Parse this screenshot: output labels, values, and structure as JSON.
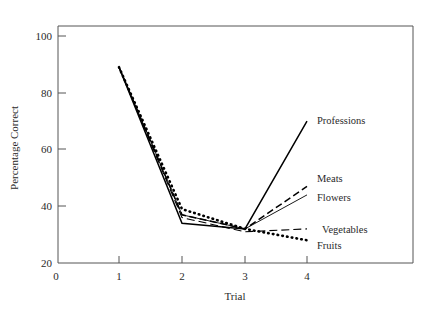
{
  "chart_data": {
    "type": "line",
    "title": "",
    "xlabel": "Trial",
    "ylabel": "Percentage Correct",
    "xlim": [
      0,
      4.6
    ],
    "ylim": [
      20,
      104
    ],
    "xticks": [
      0,
      1,
      2,
      3,
      4
    ],
    "xtick_labels": [
      "0",
      "1",
      "2",
      "3",
      "4"
    ],
    "yticks": [
      20,
      40,
      60,
      80,
      100
    ],
    "ytick_labels": [
      "20",
      "40",
      "60",
      "80",
      "100"
    ],
    "grid": false,
    "legend_position": "right-inline-labels",
    "x": [
      1,
      2,
      3,
      4
    ],
    "series": [
      {
        "name": "Professions",
        "label": "Professions",
        "values": [
          89,
          34,
          32,
          70
        ],
        "style": "solid",
        "color": "#000000"
      },
      {
        "name": "Meats",
        "label": "Meats",
        "values": [
          89,
          37,
          32,
          47
        ],
        "style": "dashed",
        "color": "#000000"
      },
      {
        "name": "Flowers",
        "label": "Flowers",
        "values": [
          89,
          37,
          32,
          44
        ],
        "style": "thin-solid",
        "color": "#000000"
      },
      {
        "name": "Vegetables",
        "label": "Vegetables",
        "values": [
          89,
          36,
          31,
          32
        ],
        "style": "long-dashed",
        "color": "#000000"
      },
      {
        "name": "Fruits",
        "label": "Fruits",
        "values": [
          89,
          39,
          32,
          28
        ],
        "style": "dotted",
        "color": "#000000"
      }
    ]
  },
  "axes": {
    "x_title": "Trial",
    "y_title": "Percentage Correct"
  },
  "colors": {
    "ink": "#000000",
    "frame": "#555555",
    "background": "#ffffff"
  }
}
